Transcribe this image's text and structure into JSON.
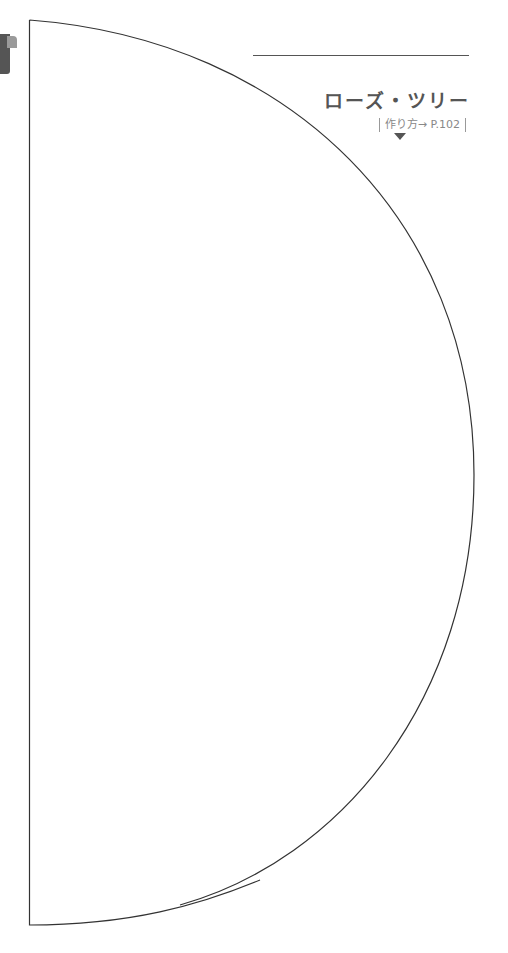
{
  "pattern": {
    "shape": "half-circle",
    "label": "ローズ・ツリー",
    "reference": "作り方→ P.102",
    "line_color": "#333333"
  },
  "page_tab": {
    "color": "#555555"
  }
}
